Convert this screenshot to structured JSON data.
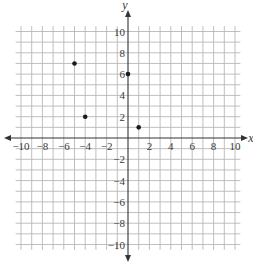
{
  "chart_data": {
    "type": "scatter",
    "title": "",
    "xlabel": "x",
    "ylabel": "y",
    "xlim": [
      -10,
      10
    ],
    "ylim": [
      -10,
      10
    ],
    "grid": true,
    "grid_step": 1,
    "x_ticks": [
      -10,
      -8,
      -6,
      -4,
      -2,
      2,
      4,
      6,
      8,
      10
    ],
    "y_ticks": [
      10,
      8,
      6,
      4,
      2,
      -2,
      -4,
      -6,
      -8,
      -10
    ],
    "points": [
      {
        "x": -5,
        "y": 7
      },
      {
        "x": -4,
        "y": 2
      },
      {
        "x": 0,
        "y": 6
      },
      {
        "x": 1,
        "y": 1
      }
    ],
    "legend": []
  },
  "colors": {
    "grid": "#b8b8b8",
    "axis": "#333333",
    "point": "#1a1a1a"
  }
}
